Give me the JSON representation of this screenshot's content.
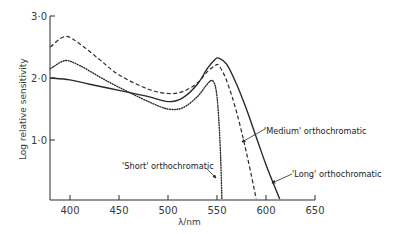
{
  "chart_data": {
    "type": "line",
    "title": "",
    "xlabel": "λ/nm",
    "ylabel": "Log relative sensitivity",
    "xlim": [
      380,
      650
    ],
    "ylim": [
      0.05,
      3.0
    ],
    "x_ticks": [
      400,
      450,
      500,
      550,
      600,
      650
    ],
    "x_tick_labels": [
      "400",
      "450",
      "500",
      "550",
      "600",
      "650"
    ],
    "y_ticks": [
      1.0,
      2.0,
      3.0
    ],
    "y_tick_labels": [
      "1·0",
      "2·0",
      "3·0"
    ],
    "grid": false,
    "legend": "none (inline annotations)",
    "series": [
      {
        "name": "'Long' orthochromatic",
        "style": "solid",
        "x": [
          380,
          400,
          420,
          450,
          480,
          500,
          515,
          530,
          540,
          548,
          552,
          560,
          570,
          580,
          590,
          600,
          610,
          614
        ],
        "values": [
          2.0,
          1.97,
          1.9,
          1.8,
          1.7,
          1.62,
          1.68,
          1.9,
          2.15,
          2.3,
          2.32,
          2.22,
          1.9,
          1.5,
          1.05,
          0.6,
          0.2,
          0.05
        ]
      },
      {
        "name": "'Medium' orthochromatic",
        "style": "dashed",
        "x": [
          380,
          395,
          410,
          430,
          450,
          480,
          500,
          515,
          530,
          540,
          548,
          552,
          560,
          570,
          580,
          590
        ],
        "values": [
          2.5,
          2.67,
          2.55,
          2.3,
          2.05,
          1.82,
          1.75,
          1.78,
          1.92,
          2.1,
          2.2,
          2.2,
          1.95,
          1.45,
          0.8,
          0.05
        ]
      },
      {
        "name": "'Short' orthochromatic",
        "style": "dotted",
        "x": [
          380,
          395,
          410,
          430,
          450,
          480,
          500,
          515,
          530,
          540,
          546,
          550,
          553,
          555
        ],
        "values": [
          2.15,
          2.28,
          2.2,
          2.02,
          1.85,
          1.62,
          1.5,
          1.52,
          1.7,
          1.9,
          1.95,
          1.7,
          1.0,
          0.05
        ]
      }
    ],
    "annotations": [
      {
        "text": "'Medium' orthochromatic",
        "points_to": "'Medium' orthochromatic"
      },
      {
        "text": "'Short' orthochromatic",
        "points_to": "'Short' orthochromatic"
      },
      {
        "text": "'Long' orthochromatic",
        "points_to": "'Long' orthochromatic"
      }
    ]
  },
  "labels": {
    "xlabel": "λ/nm",
    "ylabel": "Log relative sensitivity",
    "annot_medium": "'Medium' orthochromatic",
    "annot_short": "'Short' orthochromatic",
    "annot_long": "'Long' orthochromatic"
  },
  "colors": {
    "ink": "#2a2a2a",
    "background": "#ffffff"
  }
}
